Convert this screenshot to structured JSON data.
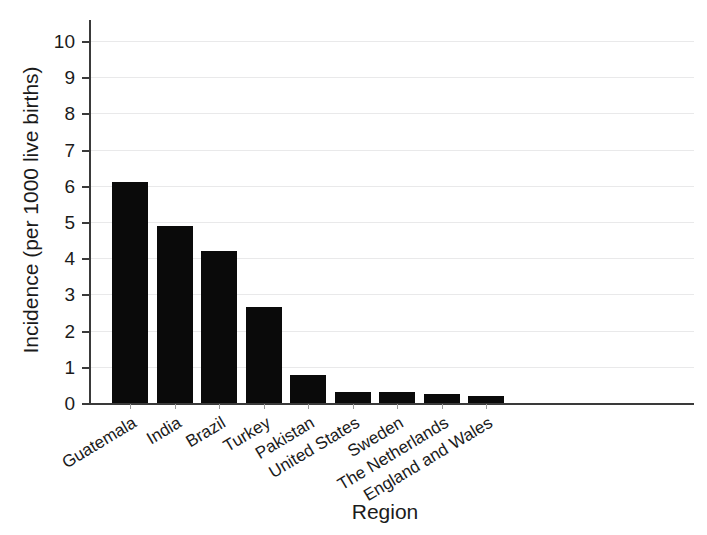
{
  "chart_data": {
    "type": "bar",
    "title": "",
    "xlabel": "Region",
    "ylabel": "Incidence (per 1000 live births)",
    "categories": [
      "Guatemala",
      "India",
      "Brazil",
      "Turkey",
      "Pakistan",
      "United States",
      "Sweden",
      "The Netherlands",
      "England and Wales"
    ],
    "values": [
      6.1,
      4.9,
      4.2,
      2.65,
      0.78,
      0.3,
      0.3,
      0.25,
      0.2
    ],
    "ylim": [
      0,
      10
    ],
    "yticks": [
      0,
      1,
      2,
      3,
      4,
      5,
      6,
      7,
      8,
      9,
      10
    ],
    "ytick_labels": [
      "0",
      "1",
      "2",
      "3",
      "4",
      "5",
      "6",
      "7",
      "8",
      "9",
      "10"
    ],
    "grid": true,
    "grid_axis": "y",
    "legend": false,
    "bar_color": "#0a0a0a",
    "background_color": "#ffffff",
    "axis_color": "#3a3a3a",
    "gridline_color": "#e9e9ea",
    "xtick_label_rotation": -31
  },
  "axes": {
    "y_title": "Incidence (per 1000 live births)",
    "x_title": "Region"
  }
}
